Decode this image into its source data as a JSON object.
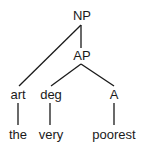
{
  "diagram": {
    "type": "syntax-tree",
    "nodes": {
      "np": {
        "label": "NP"
      },
      "ap": {
        "label": "AP"
      },
      "art": {
        "label": "art"
      },
      "deg": {
        "label": "deg"
      },
      "a": {
        "label": "A"
      },
      "the": {
        "label": "the"
      },
      "very": {
        "label": "very"
      },
      "poorest": {
        "label": "poorest"
      }
    },
    "edges": [
      [
        "NP",
        "art"
      ],
      [
        "NP",
        "AP"
      ],
      [
        "AP",
        "deg"
      ],
      [
        "AP",
        "A"
      ],
      [
        "art",
        "the"
      ],
      [
        "deg",
        "very"
      ],
      [
        "A",
        "poorest"
      ]
    ],
    "line_color": "#1a1a1a",
    "text_color": "#1a1a1a"
  }
}
